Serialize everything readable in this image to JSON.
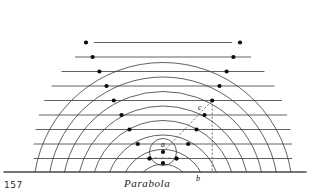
{
  "figure": {
    "caption": "Parabola",
    "page_number": "157",
    "title": "Parabola",
    "kind": "geometric-construction-diagram"
  },
  "colors": {
    "ink": "#3a3a3a",
    "ink_dark": "#111111",
    "baseline": "#4a4a4a",
    "dot": "#0a0a0a",
    "dashed": "#555555",
    "paper": "#ffffff"
  },
  "labels": [
    {
      "id": "a",
      "text": "a",
      "role": "focus",
      "x": 161,
      "y": 147
    },
    {
      "id": "b",
      "text": "b",
      "role": "foot-on-directrix",
      "x": 196,
      "y": 181
    },
    {
      "id": "c",
      "text": "c",
      "role": "point-on-parabola",
      "x": 198,
      "y": 110
    }
  ],
  "geometry": {
    "focus": {
      "x": 163,
      "y": 152
    },
    "directrix_y": 172,
    "directrix_x_start": 4,
    "directrix_x_end": 306,
    "step": 14.5,
    "arc_count": 9,
    "line_count": 9,
    "arc_radii": [
      13.5,
      28.0,
      42.5,
      57.0,
      71.5,
      86.0,
      100.5,
      115.0,
      129.5
    ],
    "line_offsets": [
      13.5,
      28.0,
      42.5,
      57.0,
      71.5,
      86.0,
      100.5,
      115.0,
      129.5
    ],
    "line_y": [
      158.5,
      144.0,
      129.5,
      115.0,
      100.5,
      86.0,
      71.5,
      57.0,
      42.5
    ],
    "center_dots": [
      {
        "x": 163,
        "y": 152
      },
      {
        "x": 163,
        "y": 163
      },
      {
        "x": 149.5,
        "y": 158.5
      },
      {
        "x": 176.5,
        "y": 158.5
      }
    ],
    "construction": {
      "radius_line": {
        "from": "a",
        "to": "c",
        "style": "dashed"
      },
      "vertical_line": {
        "from": "c",
        "to": "b",
        "style": "dashed"
      },
      "axis_tick": {
        "style": "dash-dot",
        "about": "a"
      }
    }
  },
  "chart_data": {
    "type": "scatter",
    "title": "Parabola",
    "xlabel": "",
    "ylabel": "",
    "legend": [],
    "grid": true,
    "annotations": [
      "a",
      "b",
      "c"
    ],
    "note": "Each plotted point lies on the n-th circle about focus a and on the n-th line parallel to the directrix; equal distances to focus and directrix define the parabola.",
    "points_right": [
      {
        "n": 1,
        "x": 176.5,
        "y": 158.5
      },
      {
        "n": 2,
        "x": 188.2,
        "y": 144.0
      },
      {
        "n": 3,
        "x": 196.5,
        "y": 129.5
      },
      {
        "n": 4,
        "x": 204.5,
        "y": 115.0
      },
      {
        "n": 5,
        "x": 212.2,
        "y": 100.5
      },
      {
        "n": 6,
        "x": 219.5,
        "y": 86.0
      },
      {
        "n": 7,
        "x": 226.6,
        "y": 71.5
      },
      {
        "n": 8,
        "x": 233.4,
        "y": 57.0
      },
      {
        "n": 9,
        "x": 240.0,
        "y": 42.5
      }
    ],
    "points_left": [
      {
        "n": 1,
        "x": 149.5,
        "y": 158.5
      },
      {
        "n": 2,
        "x": 137.8,
        "y": 144.0
      },
      {
        "n": 3,
        "x": 129.5,
        "y": 129.5
      },
      {
        "n": 4,
        "x": 121.5,
        "y": 115.0
      },
      {
        "n": 5,
        "x": 113.8,
        "y": 100.5
      },
      {
        "n": 6,
        "x": 106.5,
        "y": 86.0
      },
      {
        "n": 7,
        "x": 99.4,
        "y": 71.5
      },
      {
        "n": 8,
        "x": 92.6,
        "y": 57.0
      },
      {
        "n": 9,
        "x": 86.0,
        "y": 42.5
      }
    ]
  }
}
